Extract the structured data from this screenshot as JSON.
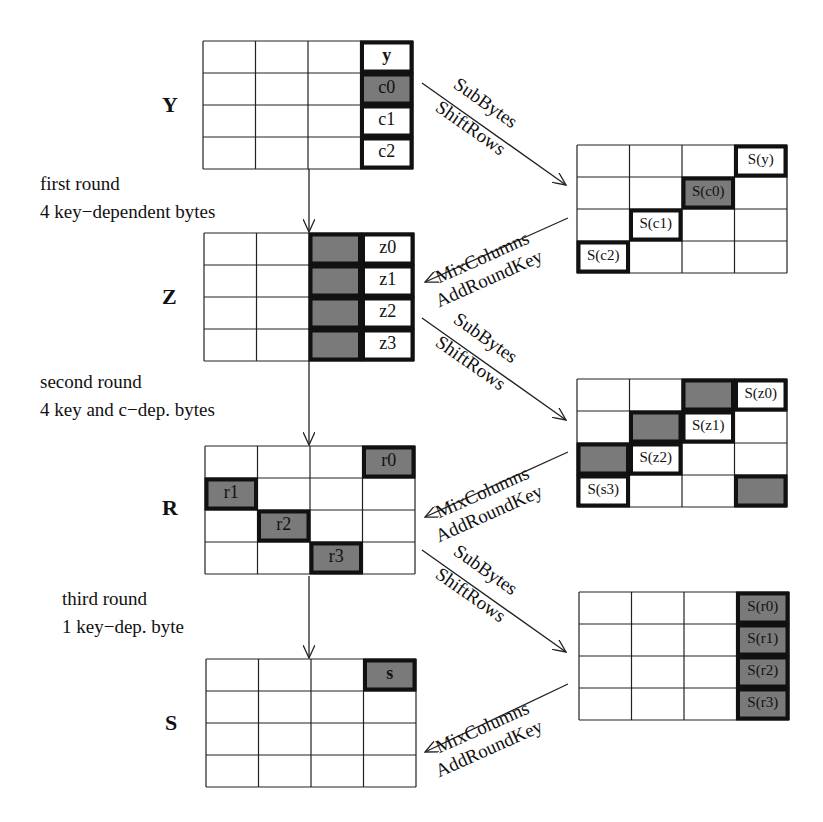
{
  "colors": {
    "shade": "#7a7a7a",
    "line": "#222222",
    "background": "#ffffff"
  },
  "state_labels": [
    "Y",
    "Z",
    "R",
    "S"
  ],
  "round_notes": [
    {
      "line1": "first round",
      "line2": "4 key−dependent bytes"
    },
    {
      "line1": "second round",
      "line2": "4 key and c−dep. bytes"
    },
    {
      "line1": "third round",
      "line2": "1 key−dep. byte"
    }
  ],
  "forward_arrow": {
    "line1": "SubBytes",
    "line2": "ShiftRows"
  },
  "backward_arrow": {
    "line1": "MixColumns",
    "line2": "AddRoundKey"
  },
  "left_grids": [
    {
      "name": "Y",
      "x": 203,
      "y": 41,
      "cells": [
        {
          "r": 0,
          "c": 3,
          "text": "y",
          "bold": true,
          "shaded": false,
          "framed": true
        },
        {
          "r": 1,
          "c": 3,
          "text": "c0",
          "shaded": true,
          "framed": true
        },
        {
          "r": 2,
          "c": 3,
          "text": "c1",
          "shaded": false,
          "framed": true
        },
        {
          "r": 3,
          "c": 3,
          "text": "c2",
          "shaded": false,
          "framed": true
        }
      ]
    },
    {
      "name": "Z",
      "x": 204,
      "y": 233,
      "cells": [
        {
          "r": 0,
          "c": 2,
          "text": "",
          "shaded": true,
          "framed": true
        },
        {
          "r": 1,
          "c": 2,
          "text": "",
          "shaded": true,
          "framed": true
        },
        {
          "r": 2,
          "c": 2,
          "text": "",
          "shaded": true,
          "framed": true
        },
        {
          "r": 3,
          "c": 2,
          "text": "",
          "shaded": true,
          "framed": true
        },
        {
          "r": 0,
          "c": 3,
          "text": "z0",
          "shaded": false,
          "framed": true
        },
        {
          "r": 1,
          "c": 3,
          "text": "z1",
          "shaded": false,
          "framed": true
        },
        {
          "r": 2,
          "c": 3,
          "text": "z2",
          "shaded": false,
          "framed": true
        },
        {
          "r": 3,
          "c": 3,
          "text": "z3",
          "shaded": false,
          "framed": true
        }
      ]
    },
    {
      "name": "R",
      "x": 205,
      "y": 446,
      "cells": [
        {
          "r": 0,
          "c": 3,
          "text": "r0",
          "shaded": true,
          "framed": true
        },
        {
          "r": 1,
          "c": 0,
          "text": "r1",
          "shaded": true,
          "framed": true
        },
        {
          "r": 2,
          "c": 1,
          "text": "r2",
          "shaded": true,
          "framed": true
        },
        {
          "r": 3,
          "c": 2,
          "text": "r3",
          "shaded": true,
          "framed": true
        }
      ]
    },
    {
      "name": "S",
      "x": 206,
      "y": 659,
      "cells": [
        {
          "r": 0,
          "c": 3,
          "text": "s",
          "bold": true,
          "shaded": true,
          "framed": true
        }
      ]
    }
  ],
  "right_grids": [
    {
      "x": 577,
      "y": 145,
      "cells": [
        {
          "r": 0,
          "c": 3,
          "text": "S(y)",
          "shaded": false,
          "framed": true
        },
        {
          "r": 1,
          "c": 2,
          "text": "S(c0)",
          "shaded": true,
          "framed": true
        },
        {
          "r": 2,
          "c": 1,
          "text": "S(c1)",
          "shaded": false,
          "framed": true
        },
        {
          "r": 3,
          "c": 0,
          "text": "S(c2)",
          "shaded": false,
          "framed": true
        }
      ]
    },
    {
      "x": 577,
      "y": 379,
      "cells": [
        {
          "r": 0,
          "c": 2,
          "text": "",
          "shaded": true,
          "framed": true
        },
        {
          "r": 0,
          "c": 3,
          "text": "S(z0)",
          "shaded": false,
          "framed": true
        },
        {
          "r": 1,
          "c": 1,
          "text": "",
          "shaded": true,
          "framed": true
        },
        {
          "r": 1,
          "c": 2,
          "text": "S(z1)",
          "shaded": false,
          "framed": true
        },
        {
          "r": 2,
          "c": 0,
          "text": "",
          "shaded": true,
          "framed": true
        },
        {
          "r": 2,
          "c": 1,
          "text": "S(z2)",
          "shaded": false,
          "framed": true
        },
        {
          "r": 3,
          "c": 0,
          "text": "S(s3)",
          "shaded": false,
          "framed": true
        },
        {
          "r": 3,
          "c": 3,
          "text": "",
          "shaded": true,
          "framed": true
        }
      ]
    },
    {
      "x": 579,
      "y": 592,
      "cells": [
        {
          "r": 0,
          "c": 3,
          "text": "S(r0)",
          "shaded": true,
          "framed": true
        },
        {
          "r": 1,
          "c": 3,
          "text": "S(r1)",
          "shaded": true,
          "framed": true
        },
        {
          "r": 2,
          "c": 3,
          "text": "S(r2)",
          "shaded": true,
          "framed": true
        },
        {
          "r": 3,
          "c": 3,
          "text": "S(r3)",
          "shaded": true,
          "framed": true
        }
      ]
    }
  ]
}
